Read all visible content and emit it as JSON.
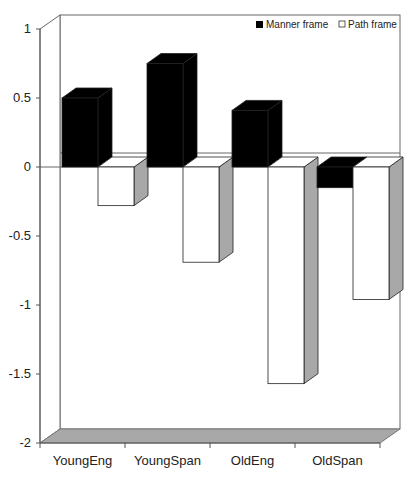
{
  "chart_data": {
    "type": "bar",
    "style": "3d-clustered-column",
    "title": "",
    "xlabel": "",
    "ylabel": "",
    "categories": [
      "YoungEng",
      "YoungSpan",
      "OldEng",
      "OldSpan"
    ],
    "series": [
      {
        "name": "Manner frame",
        "color": "#000000",
        "values": [
          0.5,
          0.75,
          0.41,
          -0.15
        ]
      },
      {
        "name": "Path frame",
        "color": "#ffffff",
        "values": [
          -0.28,
          -0.69,
          -1.57,
          -0.96
        ]
      }
    ],
    "ylim": [
      -2,
      1
    ],
    "yticks": [
      1,
      0.5,
      0,
      -0.5,
      -1,
      -1.5,
      -2
    ],
    "ytick_labels": [
      "1",
      "0.5",
      "0",
      "-0.5",
      "-1",
      "-1.5",
      "-2"
    ],
    "grid": false,
    "legend": {
      "position": "top-right",
      "entries": [
        "Manner frame",
        "Path frame"
      ]
    },
    "colors": {
      "floor": "#a8a8a8",
      "bar_side": "#a8a8a8",
      "axis": "#555555"
    }
  }
}
